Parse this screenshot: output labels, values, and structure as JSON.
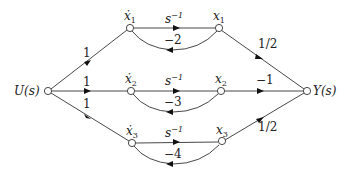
{
  "diagram": {
    "type": "signal-flow-graph",
    "input_label": "U(s)",
    "output_label": "Y(s)",
    "integrator_gain": "s",
    "integrator_exp": "−1",
    "branches": [
      {
        "id": "1",
        "state_dot": "ẋ",
        "state": "x",
        "index": "1",
        "input_gain": "1",
        "feedback_gain": "−2",
        "output_gain": "1/2"
      },
      {
        "id": "2",
        "state_dot": "ẋ",
        "state": "x",
        "index": "2",
        "input_gain": "1",
        "feedback_gain": "−3",
        "output_gain": "−1"
      },
      {
        "id": "3",
        "state_dot": "ẋ",
        "state": "x",
        "index": "3",
        "input_gain": "1",
        "feedback_gain": "−4",
        "output_gain": "1/2"
      }
    ],
    "colors": {
      "line": "#333333",
      "node_fill": "#ffffff",
      "text": "#222222"
    }
  }
}
